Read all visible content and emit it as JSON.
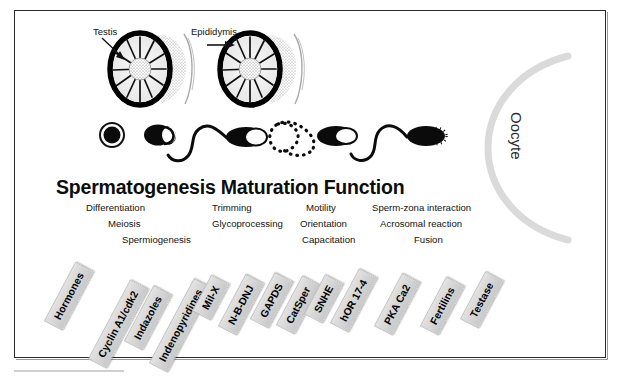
{
  "figure": {
    "title": "Spermatogenesis Maturation Function",
    "oocyte_label": "Oocyte"
  },
  "callouts": [
    {
      "name": "testis",
      "text": "Testis"
    },
    {
      "name": "epididymis",
      "text": "Epididymis"
    }
  ],
  "process_groups": [
    {
      "group": "spermatogenesis",
      "labels": [
        "Differentiation",
        "Meiosis",
        "Spermiogenesis"
      ]
    },
    {
      "group": "maturation",
      "labels": [
        "Trimming",
        "Glycoprocessing"
      ]
    },
    {
      "group": "motility",
      "labels": [
        "Motility",
        "Orientation",
        "Capacitation"
      ]
    },
    {
      "group": "fertilization",
      "labels": [
        "Sperm-zona interaction",
        "Acrosomal reaction",
        "Fusion"
      ]
    }
  ],
  "targets": [
    {
      "label": "Hormones"
    },
    {
      "label": "Cyclin A1/cdk2"
    },
    {
      "label": "Indazoles"
    },
    {
      "label": "Indenopyridines"
    },
    {
      "label": "Mil-X"
    },
    {
      "label": "N-B-DNJ"
    },
    {
      "label": "GAPDS"
    },
    {
      "label": "CatSper"
    },
    {
      "label": "SNHE"
    },
    {
      "label": "hOR 17-4"
    },
    {
      "label": "PKA Ca2"
    },
    {
      "label": "Fertilins"
    },
    {
      "label": "Testase"
    }
  ],
  "cells": [
    {
      "name": "spermatogonium"
    },
    {
      "name": "round-spermatid"
    },
    {
      "name": "testicular-spermatozoon"
    },
    {
      "name": "transit-spermatozoon"
    },
    {
      "name": "epididymal-spermatozoon"
    },
    {
      "name": "capacitated-spermatozoon"
    }
  ],
  "colors": {
    "ink": "#0d0d0d",
    "tag_fill": "#d6d6d6",
    "oocyte": "#d9d9d9",
    "frame": "#2b2b2b"
  }
}
